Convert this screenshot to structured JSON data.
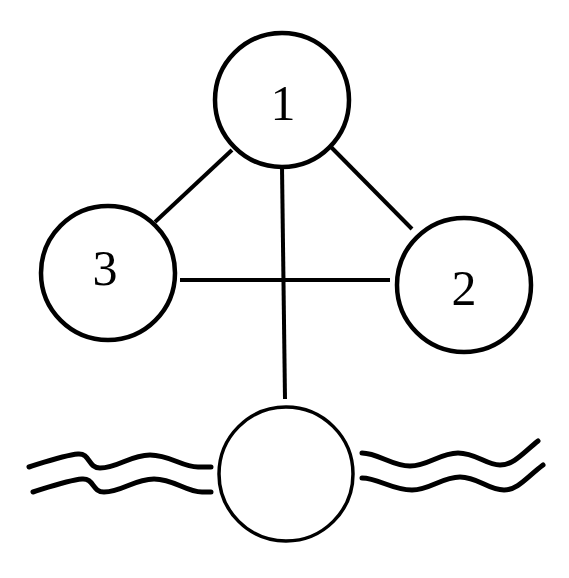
{
  "diagram": {
    "title": "",
    "nodes": [
      {
        "id": "node-1",
        "label": "1"
      },
      {
        "id": "node-2",
        "label": "2"
      },
      {
        "id": "node-3",
        "label": "3"
      },
      {
        "id": "membrane-node",
        "label": ""
      }
    ],
    "edges": [
      {
        "from": "1",
        "to": "3"
      },
      {
        "from": "1",
        "to": "2"
      },
      {
        "from": "3",
        "to": "2"
      },
      {
        "from": "1",
        "to": "membrane-node"
      }
    ],
    "membrane": {
      "description": "double wavy lines passing through bottom circle"
    },
    "colors": {
      "stroke": "#000000",
      "background": "#ffffff"
    }
  }
}
